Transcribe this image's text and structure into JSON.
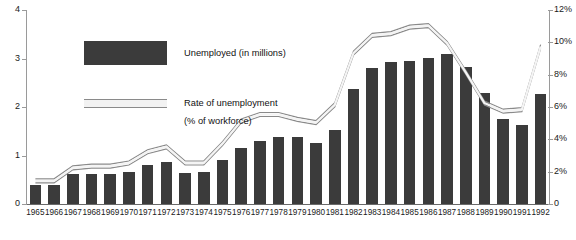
{
  "title_remnant": "· ·  ·",
  "chart_data": {
    "type": "bar",
    "title": "",
    "xlabel": "",
    "ylabel": "",
    "grid": false,
    "legend_position": "inside-top-left",
    "categories": [
      "1965",
      "1966",
      "1967",
      "1968",
      "1969",
      "1970",
      "1971",
      "1972",
      "1973",
      "1974",
      "1975",
      "1976",
      "1977",
      "1978",
      "1979",
      "1980",
      "1981",
      "1982",
      "1983",
      "1984",
      "1985",
      "1986",
      "1987",
      "1988",
      "1989",
      "1990",
      "1991",
      "1992"
    ],
    "series": [
      {
        "name": "Unemployed (in millions)",
        "type": "bar",
        "axis": "left",
        "color": "#3b3b3b",
        "values": [
          0.4,
          0.4,
          0.61,
          0.62,
          0.61,
          0.66,
          0.81,
          0.86,
          0.64,
          0.65,
          0.91,
          1.15,
          1.3,
          1.39,
          1.39,
          1.25,
          1.52,
          2.37,
          2.8,
          2.92,
          2.95,
          3.02,
          3.1,
          2.83,
          2.28,
          1.75,
          1.62,
          2.26
        ]
      },
      {
        "name": "Rate of unemployment (% of workforce)",
        "type": "line",
        "axis": "right",
        "color": "#8a8a8a",
        "unit": "%",
        "values": [
          1.5,
          1.5,
          2.3,
          2.4,
          2.4,
          2.6,
          3.3,
          3.6,
          2.6,
          2.6,
          3.8,
          5.2,
          5.6,
          5.6,
          5.3,
          5.1,
          6.2,
          9.4,
          10.5,
          10.6,
          11.0,
          11.1,
          10.0,
          8.2,
          6.3,
          5.8,
          5.9,
          9.8
        ]
      }
    ],
    "left_axis": {
      "ticks": [
        "0",
        "1",
        "2",
        "3",
        "4"
      ],
      "min": 0,
      "max": 4,
      "unit": "millions"
    },
    "right_axis": {
      "ticks": [
        "0",
        "2%",
        "4%",
        "6%",
        "8%",
        "10%",
        "12%"
      ],
      "min": 0,
      "max": 12,
      "unit": "%"
    }
  },
  "legend": {
    "bar_label": "Unemployed (in millions)",
    "line_label": "Rate of unemployment",
    "line_sublabel": "(% of workforce)"
  }
}
